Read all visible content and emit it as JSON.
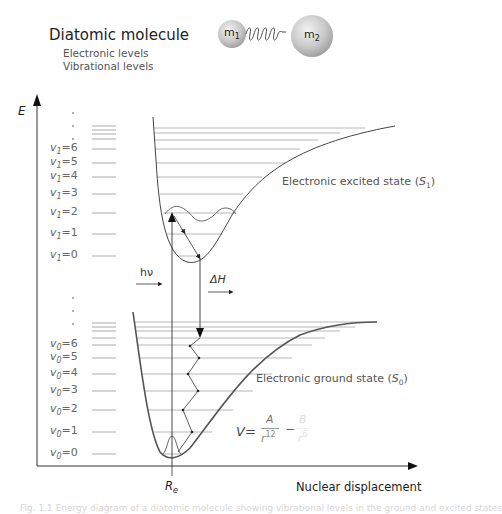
{
  "title": "Diatomic molecule",
  "subtitle_lines": [
    "Electronic levels",
    "Vibrational levels"
  ],
  "molecule": {
    "mass1_label": "m",
    "mass1_sub": "1",
    "mass2_label": "m",
    "mass2_sub": "2",
    "spring": "spring-bond"
  },
  "axes": {
    "y_label": "E",
    "x_label": "Nuclear displacement",
    "x_tick_label": "R",
    "x_tick_sub": "e"
  },
  "excited_state": {
    "label": "Electronic excited state (",
    "symbol": "S",
    "sub": "1",
    "close": ")",
    "levels": [
      {
        "var": "v",
        "sub": "1",
        "value": "=6"
      },
      {
        "var": "v",
        "sub": "1",
        "value": "=5"
      },
      {
        "var": "v",
        "sub": "1",
        "value": "=4"
      },
      {
        "var": "v",
        "sub": "1",
        "value": "=3"
      },
      {
        "var": "v",
        "sub": "1",
        "value": "=2"
      },
      {
        "var": "v",
        "sub": "1",
        "value": "=1"
      },
      {
        "var": "v",
        "sub": "1",
        "value": "=0"
      }
    ]
  },
  "ground_state": {
    "label": "Electronic ground state (",
    "symbol": "S",
    "sub": "0",
    "close": ")",
    "levels": [
      {
        "var": "v",
        "sub": "0",
        "value": "=6"
      },
      {
        "var": "v",
        "sub": "0",
        "value": "=5"
      },
      {
        "var": "v",
        "sub": "0",
        "value": "=4"
      },
      {
        "var": "v",
        "sub": "0",
        "value": "=3"
      },
      {
        "var": "v",
        "sub": "0",
        "value": "=2"
      },
      {
        "var": "v",
        "sub": "0",
        "value": "=1"
      },
      {
        "var": "v",
        "sub": "0",
        "value": "=0"
      }
    ]
  },
  "transitions": {
    "absorption_label": "hν",
    "relaxation_label": "ΔH"
  },
  "formula": {
    "lhs": "V=",
    "num1": "A",
    "den1": "r",
    "den1_exp": "12",
    "minus": "−",
    "num2": "B",
    "den2": "r",
    "den2_exp": "6"
  },
  "caption": "Fig. 1.1  Energy diagram of a diatomic molecule showing vibrational levels in the ground and excited states"
}
